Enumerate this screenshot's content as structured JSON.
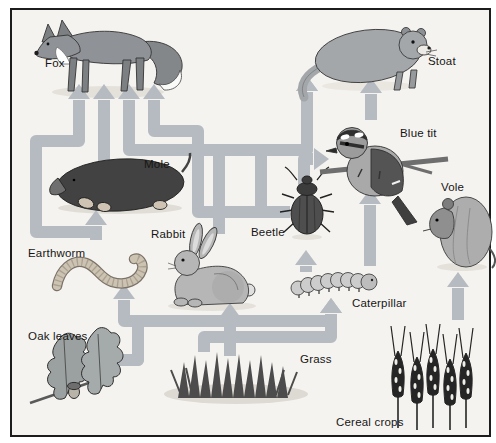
{
  "diagram": {
    "kind": "food web diagram",
    "habitat_note": ""
  },
  "colors": {
    "page": "#ffffff",
    "background": "#f5f3ef",
    "frame": "#1c1c1c",
    "arrow": "#b5bbc1",
    "label": "#161616"
  },
  "organisms": [
    {
      "id": "fox",
      "label": "Fox"
    },
    {
      "id": "stoat",
      "label": "Stoat"
    },
    {
      "id": "mole",
      "label": "Mole"
    },
    {
      "id": "blue-tit",
      "label": "Blue tit"
    },
    {
      "id": "vole",
      "label": "Vole"
    },
    {
      "id": "earthworm",
      "label": "Earthworm"
    },
    {
      "id": "rabbit",
      "label": "Rabbit"
    },
    {
      "id": "beetle",
      "label": "Beetle"
    },
    {
      "id": "caterpillar",
      "label": "Caterpillar"
    },
    {
      "id": "grass",
      "label": "Grass"
    },
    {
      "id": "oak-leaves",
      "label": "Oak leaves"
    },
    {
      "id": "cereal-crops",
      "label": "Cereal crops"
    }
  ],
  "arrows": [
    {
      "from": "earthworm",
      "to": "fox",
      "dir": "up",
      "tip": [
        79,
        84
      ],
      "points": [
        [
          100,
          232
        ],
        [
          36,
          232
        ],
        [
          36,
          141
        ],
        [
          79,
          141
        ],
        [
          79,
          100
        ]
      ]
    },
    {
      "from": "earthworm",
      "to": "mole",
      "dir": "up",
      "tip": [
        96,
        210
      ],
      "points": [
        [
          96,
          240
        ],
        [
          96,
          226
        ]
      ]
    },
    {
      "from": "mole",
      "to": "fox",
      "dir": "up",
      "tip": [
        104,
        84
      ],
      "points": [
        [
          104,
          162
        ],
        [
          104,
          100
        ]
      ]
    },
    {
      "from": "rabbit",
      "to": "fox",
      "dir": "up",
      "tip": [
        129,
        84
      ],
      "points": [
        [
          219,
          234
        ],
        [
          219,
          150
        ],
        [
          129,
          150
        ],
        [
          129,
          100
        ]
      ]
    },
    {
      "from": "rabbit",
      "to": "stoat",
      "dir": "up",
      "tip": [
        307,
        76
      ],
      "points": [
        [
          219,
          234
        ],
        [
          219,
          150
        ],
        [
          307,
          150
        ],
        [
          307,
          92
        ]
      ]
    },
    {
      "from": "beetle",
      "to": "fox",
      "dir": "up",
      "tip": [
        154,
        84
      ],
      "points": [
        [
          290,
          212
        ],
        [
          198,
          212
        ],
        [
          198,
          131
        ],
        [
          154,
          131
        ],
        [
          154,
          100
        ]
      ]
    },
    {
      "from": "beetle",
      "to": "stoat",
      "dir": "up",
      "tip": [
        307,
        76
      ],
      "points": [
        [
          290,
          212
        ],
        [
          261,
          212
        ],
        [
          261,
          150
        ],
        [
          307,
          150
        ],
        [
          307,
          92
        ]
      ]
    },
    {
      "from": "grass",
      "to": "rabbit",
      "dir": "up",
      "tip": [
        230,
        303
      ],
      "points": [
        [
          230,
          356
        ],
        [
          230,
          318
        ]
      ]
    },
    {
      "from": "oak-leaves",
      "to": "earthworm",
      "dir": "up",
      "tip": [
        124,
        284
      ],
      "points": [
        [
          112,
          360
        ],
        [
          138,
          360
        ],
        [
          138,
          321
        ],
        [
          124,
          321
        ],
        [
          124,
          300
        ]
      ]
    },
    {
      "from": "oak-leaves",
      "to": "caterpillar",
      "dir": "up",
      "tip": [
        331,
        298
      ],
      "points": [
        [
          112,
          360
        ],
        [
          138,
          360
        ],
        [
          138,
          321
        ],
        [
          331,
          321
        ],
        [
          331,
          314
        ]
      ]
    },
    {
      "from": "grass",
      "to": "caterpillar",
      "dir": "up",
      "tip": [
        331,
        298
      ],
      "points": [
        [
          204,
          352
        ],
        [
          204,
          337
        ],
        [
          331,
          337
        ],
        [
          331,
          314
        ]
      ]
    },
    {
      "from": "cereal-crops",
      "to": "vole",
      "dir": "up",
      "tip": [
        458,
        272
      ],
      "points": [
        [
          458,
          320
        ],
        [
          458,
          288
        ]
      ]
    },
    {
      "from": "caterpillar",
      "to": "beetle",
      "dir": "up",
      "tip": [
        306,
        250
      ],
      "points": [
        [
          306,
          272
        ],
        [
          306,
          266
        ]
      ]
    },
    {
      "from": "caterpillar",
      "to": "blue-tit",
      "dir": "up",
      "tip": [
        370,
        189
      ],
      "points": [
        [
          370,
          266
        ],
        [
          370,
          205
        ]
      ]
    },
    {
      "from": "beetle",
      "to": "blue-tit",
      "dir": "right",
      "tip": [
        329,
        159
      ],
      "points": [
        [
          304,
          186
        ],
        [
          304,
          159
        ],
        [
          313,
          159
        ]
      ]
    },
    {
      "from": "blue-tit",
      "to": "stoat",
      "dir": "up",
      "tip": [
        371,
        78
      ],
      "points": [
        [
          371,
          120
        ],
        [
          371,
          94
        ]
      ]
    }
  ]
}
